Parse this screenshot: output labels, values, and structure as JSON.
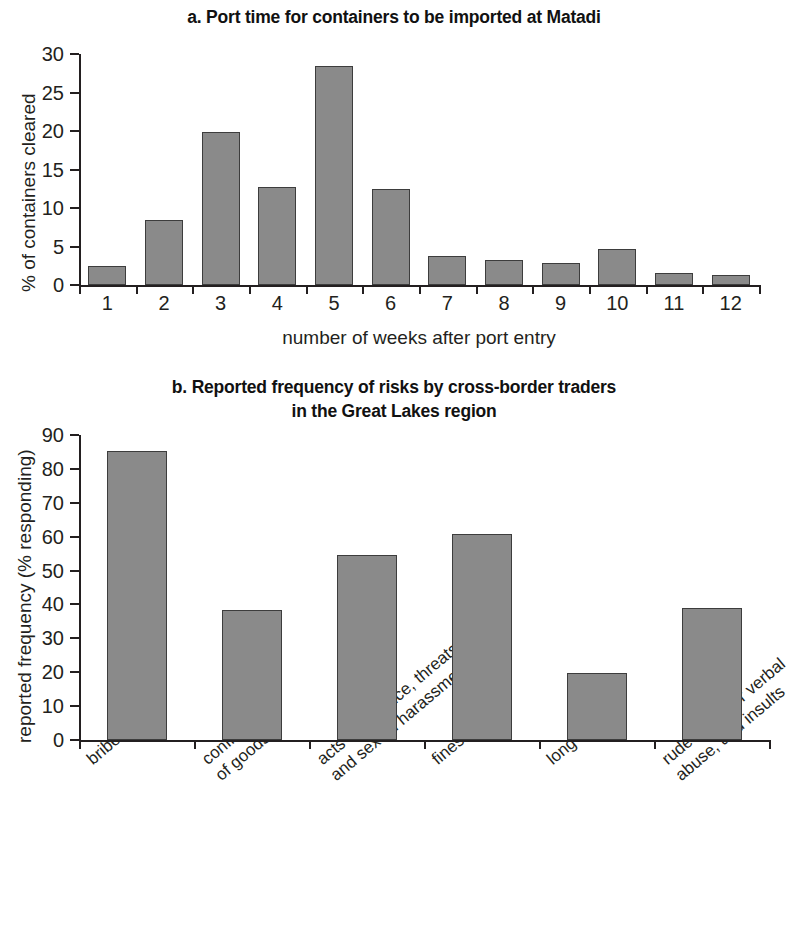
{
  "figure": {
    "panel_a": {
      "label": "a.",
      "title": "a. Port time for containers to be imported at Matadi",
      "ylabel": "% of containers cleared",
      "xlabel": "number of weeks after port entry",
      "yticks": [
        "0",
        "5",
        "10",
        "15",
        "20",
        "25",
        "30"
      ],
      "xticks": [
        "1",
        "2",
        "3",
        "4",
        "5",
        "6",
        "7",
        "8",
        "9",
        "10",
        "11",
        "12"
      ]
    },
    "panel_b": {
      "label": "b.",
      "title_line1": "b. Reported frequency of risks by cross-border traders",
      "title_line2": "in the Great Lakes region",
      "ylabel": "reported frequency (% responding)",
      "yticks": [
        "0",
        "10",
        "20",
        "30",
        "40",
        "50",
        "60",
        "70",
        "80",
        "90"
      ],
      "xticks": [
        {
          "line1": "bribes",
          "line2": ""
        },
        {
          "line1": "confiscation",
          "line2": "of goods"
        },
        {
          "line1": "acts of violence, threats,",
          "line2": "and sexual harassment"
        },
        {
          "line1": "fines",
          "line2": ""
        },
        {
          "line1": "long waits",
          "line2": ""
        },
        {
          "line1": "rude behavior verbal",
          "line2": "abuse, and insults"
        }
      ]
    },
    "colors": {
      "bar_fill": "#8a8a8a",
      "bar_stroke": "#3d3d3d",
      "axis": "#231f20",
      "text": "#231f20",
      "background": "#ffffff"
    }
  },
  "chart_data": [
    {
      "type": "bar",
      "id": "panel-a",
      "title": "a. Port time for containers to be imported at Matadi",
      "xlabel": "number of weeks after port entry",
      "ylabel": "% of containers cleared",
      "categories": [
        "1",
        "2",
        "3",
        "4",
        "5",
        "6",
        "7",
        "8",
        "9",
        "10",
        "11",
        "12"
      ],
      "values": [
        2.5,
        8.4,
        19.9,
        12.7,
        28.5,
        12.5,
        3.8,
        3.2,
        2.8,
        4.7,
        1.5,
        1.3
      ],
      "ylim": [
        0,
        30
      ],
      "ytick_step": 5,
      "grid": false,
      "legend": "none"
    },
    {
      "type": "bar",
      "id": "panel-b",
      "title": "b. Reported frequency of risks by cross-border traders in the Great Lakes region",
      "xlabel": "",
      "ylabel": "reported frequency (% responding)",
      "categories": [
        "bribes",
        "confiscation of goods",
        "acts of violence, threats, and sexual harassment",
        "fines",
        "long waits",
        "rude behavior verbal abuse, and insults"
      ],
      "values": [
        85.2,
        38.4,
        54.5,
        60.8,
        19.9,
        39.0
      ],
      "ylim": [
        0,
        90
      ],
      "ytick_step": 10,
      "grid": false,
      "legend": "none"
    }
  ]
}
